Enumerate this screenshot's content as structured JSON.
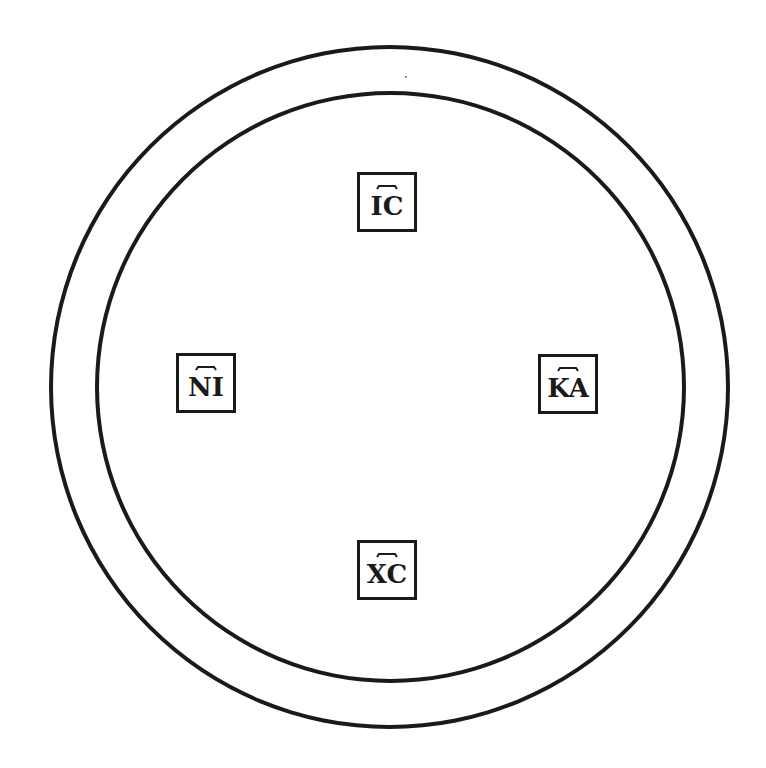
{
  "diagram": {
    "type": "concentric-circles-with-monograms",
    "stroke_color": "#1a1a1a",
    "background_color": "#ffffff",
    "circles": [
      {
        "name": "outer-circle",
        "center": [
          389,
          386
        ],
        "radius": 340
      },
      {
        "name": "inner-circle",
        "center": [
          390,
          387
        ],
        "radius": 294
      }
    ],
    "labels": {
      "top": {
        "text": "IC",
        "titlo": true,
        "meaning": "Jesus"
      },
      "left": {
        "text": "NI",
        "titlo": true,
        "meaning": "Nika (conquers)"
      },
      "right": {
        "text": "KA",
        "titlo": true,
        "meaning": "Nika (conquers)"
      },
      "bottom": {
        "text": "XC",
        "titlo": true,
        "meaning": "Christ"
      }
    }
  }
}
